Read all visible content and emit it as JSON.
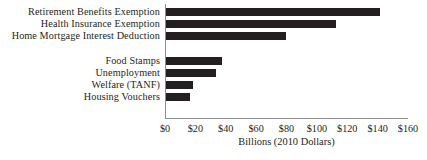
{
  "chart_data": {
    "type": "bar",
    "orientation": "horizontal",
    "title": "",
    "xlabel": "Billions (2010 Dollars)",
    "ylabel": "",
    "xlim": [
      0,
      160
    ],
    "xtick_labels": [
      "$0",
      "$20",
      "$40",
      "$60",
      "$80",
      "$100",
      "$120",
      "$140",
      "$160"
    ],
    "xticks": [
      0,
      20,
      40,
      60,
      80,
      100,
      120,
      140,
      160
    ],
    "grid": false,
    "legend": false,
    "bar_color": "#231f20",
    "axis_color": "#8e8e8e",
    "categories": [
      "Retirement Benefits Exemption",
      "Health Insurance Exemption",
      "Home Mortgage Interest Deduction",
      "Food Stamps",
      "Unemployment",
      "Welfare (TANF)",
      "Housing Vouchers"
    ],
    "values": [
      141,
      112,
      79,
      37,
      33,
      18,
      16
    ],
    "slots": [
      0,
      1,
      2,
      4,
      5,
      6,
      7
    ],
    "group_gap_after_index": 2
  }
}
